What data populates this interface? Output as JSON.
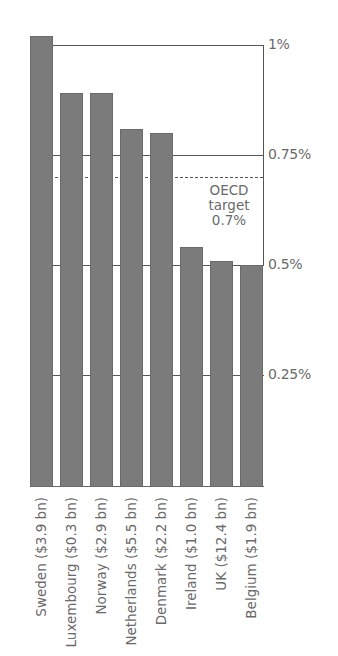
{
  "chart_data": {
    "type": "bar",
    "title": "",
    "xlabel": "",
    "ylabel": "",
    "ylim": [
      0,
      1.0
    ],
    "categories": [
      "Sweden ($3.9 bn)",
      "Luxembourg ($0.3 bn)",
      "Norway ($2.9 bn)",
      "Netherlands ($5.5 bn)",
      "Denmark ($2.2 bn)",
      "Ireland ($1.0 bn)",
      "UK ($12.4 bn)",
      "Belgium ($1.9 bn)"
    ],
    "values": [
      1.02,
      0.89,
      0.89,
      0.81,
      0.8,
      0.54,
      0.51,
      0.5
    ],
    "unit": "% of GNI",
    "y_ticks": [
      {
        "value": 1.0,
        "label": "1%"
      },
      {
        "value": 0.75,
        "label": "0.75%"
      },
      {
        "value": 0.5,
        "label": "0.5%"
      },
      {
        "value": 0.25,
        "label": "0.25%"
      }
    ],
    "reference_line": {
      "value": 0.7,
      "style": "dashed",
      "label_lines": [
        "OECD",
        "target",
        "0.7%"
      ]
    },
    "grid": true,
    "legend": null,
    "colors": {
      "bar": "#7b7b7b",
      "line": "#555555",
      "text": "#6a6a6a"
    }
  }
}
